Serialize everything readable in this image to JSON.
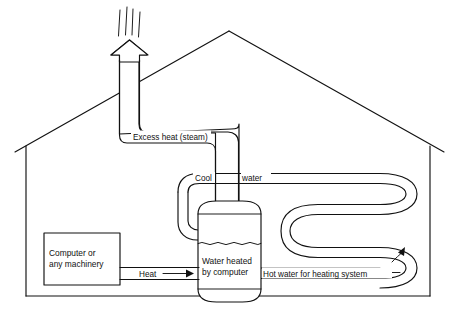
{
  "diagram": {
    "ink_color": "#111111",
    "background_color": "#ffffff",
    "labels": {
      "excess_heat": "Excess heat (steam)",
      "cool_left": "Cool",
      "cool_right": "water",
      "cool_full": "Cool water",
      "computer_line1": "Computer or",
      "computer_line2": "any machinery",
      "heat": "Heat",
      "tank_line1": "Water heated",
      "tank_line2": "by computer",
      "hot_water": "Hot water for heating system"
    },
    "components": [
      {
        "name": "house-outline",
        "kind": "structure"
      },
      {
        "name": "steam-duct",
        "kind": "duct"
      },
      {
        "name": "steam-arrow",
        "kind": "arrow"
      },
      {
        "name": "steam-wisps",
        "kind": "decoration",
        "count": 4
      },
      {
        "name": "water-tank",
        "kind": "vessel"
      },
      {
        "name": "cool-water-pipe",
        "kind": "pipe"
      },
      {
        "name": "hot-water-pipe",
        "kind": "pipe"
      },
      {
        "name": "radiator-serpentine",
        "kind": "pipe"
      },
      {
        "name": "computer-box",
        "kind": "equipment"
      },
      {
        "name": "heat-duct",
        "kind": "duct"
      },
      {
        "name": "flow-arrow",
        "kind": "arrow"
      }
    ]
  }
}
